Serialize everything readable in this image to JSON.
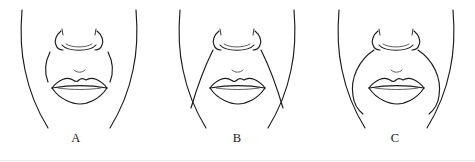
{
  "figure": {
    "width": 475,
    "height": 162,
    "background_color": "#ffffff",
    "line_color": "#1a1a1a",
    "panel_count": 3
  },
  "panels": [
    {
      "label": "A",
      "fold_type": "short hooked nasolabial fold ending at mouth corner",
      "description": "Lower face outline with nose, lips and short curved nasolabial folds"
    },
    {
      "label": "B",
      "fold_type": "long straight diagonal nasolabial fold extending below mouth corner",
      "description": "Lower face outline with nose, lips and long straight nasolabial folds"
    },
    {
      "label": "C",
      "fold_type": "curved bowed nasolabial fold arcing around the mouth",
      "description": "Lower face outline with nose, lips and curved bowed nasolabial folds"
    }
  ],
  "captions": {
    "a": "A",
    "b": "B",
    "c": "C"
  },
  "icons": {
    "nose": "nose-icon",
    "mouth": "mouth-icon",
    "jaw": "jaw-contour-icon",
    "fold": "nasolabial-fold-icon",
    "philtrum": "philtrum-tick-icon"
  }
}
